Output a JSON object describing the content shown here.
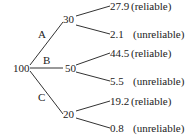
{
  "tree": {
    "root": "100",
    "branches": [
      {
        "label": "A",
        "node": "30",
        "leaves": [
          {
            "value": "27.9",
            "status": "(reliable)"
          },
          {
            "value": "2.1",
            "status": "(unreliable)"
          }
        ]
      },
      {
        "label": "B",
        "node": "50",
        "leaves": [
          {
            "value": "44.5",
            "status": "(reliable)"
          },
          {
            "value": "5.5",
            "status": "(unreliable)"
          }
        ]
      },
      {
        "label": "C",
        "node": "20",
        "leaves": [
          {
            "value": "19.2",
            "status": "(reliable)"
          },
          {
            "value": "0.8",
            "status": "(unreliable)"
          }
        ]
      }
    ]
  }
}
